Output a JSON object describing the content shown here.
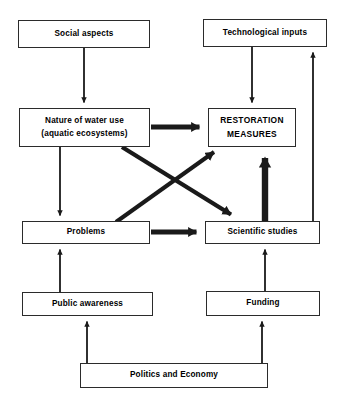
{
  "diagram": {
    "type": "flowchart",
    "background_color": "#ffffff",
    "line_color": "#1a1a1a",
    "text_color": "#000000",
    "nodes": [
      {
        "id": "social-aspects",
        "label": "Social aspects",
        "lines": [
          "Social aspects"
        ],
        "x": 18,
        "y": 20,
        "w": 132,
        "h": 28,
        "style": "normal"
      },
      {
        "id": "technological-inputs",
        "label": "Technological inputs",
        "lines": [
          "Technological inputs"
        ],
        "x": 203,
        "y": 19,
        "w": 124,
        "h": 28,
        "style": "normal"
      },
      {
        "id": "nature-of-water-use",
        "label": "Nature of water use (aquatic ecosystems)",
        "lines": [
          "Nature of water use",
          "(aquatic ecosystems)"
        ],
        "x": 19,
        "y": 108,
        "w": 131,
        "h": 39,
        "style": "normal"
      },
      {
        "id": "restoration-measures",
        "label": "RESTORATION MEASURES",
        "lines": [
          "RESTORATION",
          "MEASURES"
        ],
        "x": 208,
        "y": 108,
        "w": 88,
        "h": 39,
        "style": "caps"
      },
      {
        "id": "problems",
        "label": "Problems",
        "lines": [
          "Problems"
        ],
        "x": 22,
        "y": 221,
        "w": 128,
        "h": 23,
        "style": "normal"
      },
      {
        "id": "scientific-studies",
        "label": "Scientific studies",
        "lines": [
          "Scientific studies"
        ],
        "x": 205,
        "y": 221,
        "w": 115,
        "h": 23,
        "style": "normal"
      },
      {
        "id": "public-awareness",
        "label": "Public awareness",
        "lines": [
          "Public awareness"
        ],
        "x": 22,
        "y": 292,
        "w": 131,
        "h": 24,
        "style": "normal"
      },
      {
        "id": "funding",
        "label": "Funding",
        "lines": [
          "Funding"
        ],
        "x": 206,
        "y": 291,
        "w": 114,
        "h": 25,
        "style": "normal"
      },
      {
        "id": "politics-and-economy",
        "label": "Politics and Economy",
        "lines": [
          "Politics and Economy"
        ],
        "x": 80,
        "y": 363,
        "w": 188,
        "h": 25,
        "style": "normal"
      }
    ],
    "edges": [
      {
        "id": "social-to-nature",
        "from": "social-aspects",
        "to": "nature-of-water-use",
        "weight": "thin",
        "direction": "down"
      },
      {
        "id": "technological-to-restoration",
        "from": "technological-inputs",
        "to": "restoration-measures",
        "weight": "thin",
        "direction": "down"
      },
      {
        "id": "nature-to-restoration",
        "from": "nature-of-water-use",
        "to": "restoration-measures",
        "weight": "thick",
        "direction": "right"
      },
      {
        "id": "nature-to-problems",
        "from": "nature-of-water-use",
        "to": "problems",
        "weight": "thin",
        "direction": "down"
      },
      {
        "id": "nature-to-scientific",
        "from": "nature-of-water-use",
        "to": "scientific-studies",
        "weight": "thick",
        "direction": "diagonal-down-right"
      },
      {
        "id": "problems-to-restoration",
        "from": "problems",
        "to": "restoration-measures",
        "weight": "thick",
        "direction": "diagonal-up-right"
      },
      {
        "id": "problems-to-scientific",
        "from": "problems",
        "to": "scientific-studies",
        "weight": "thick",
        "direction": "right"
      },
      {
        "id": "scientific-to-restoration",
        "from": "scientific-studies",
        "to": "restoration-measures",
        "weight": "extra-thick",
        "direction": "up"
      },
      {
        "id": "scientific-to-technological",
        "from": "scientific-studies",
        "to": "technological-inputs",
        "weight": "thin",
        "direction": "up"
      },
      {
        "id": "public-awareness-to-problems",
        "from": "public-awareness",
        "to": "problems",
        "weight": "thin",
        "direction": "up"
      },
      {
        "id": "funding-to-scientific",
        "from": "funding",
        "to": "scientific-studies",
        "weight": "thin",
        "direction": "up"
      },
      {
        "id": "politics-to-public-awareness",
        "from": "politics-and-economy",
        "to": "public-awareness",
        "weight": "thin",
        "direction": "up"
      },
      {
        "id": "politics-to-funding",
        "from": "politics-and-economy",
        "to": "funding",
        "weight": "thin",
        "direction": "up"
      }
    ]
  }
}
